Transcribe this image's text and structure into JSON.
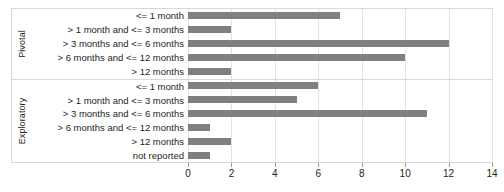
{
  "chart_data": {
    "type": "bar",
    "orientation": "horizontal",
    "title": "",
    "xlabel": "",
    "ylabel": "",
    "xlim": [
      0,
      14
    ],
    "xticks": [
      0,
      2,
      4,
      6,
      8,
      10,
      12,
      14
    ],
    "grid": true,
    "legend": "none",
    "bar_color": "#808080",
    "frame_color": "#d9d9d9",
    "grid_color": "#e2e2e2",
    "groups": [
      {
        "name": "Pivotal",
        "categories": [
          "<= 1 month",
          "> 1 month and <= 3 months",
          "> 3 months and <= 6 months",
          "> 6 months and <= 12 months",
          "> 12 months"
        ],
        "values": [
          7,
          2,
          12,
          10,
          2
        ]
      },
      {
        "name": "Exploratory",
        "categories": [
          "<= 1 month",
          "> 1 month and <= 3 months",
          "> 3 months and <= 6 months",
          "> 6 months and <= 12 months",
          "> 12 months",
          "not reported"
        ],
        "values": [
          6,
          5,
          11,
          1,
          2,
          1
        ]
      }
    ]
  }
}
